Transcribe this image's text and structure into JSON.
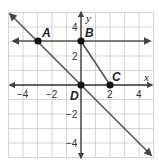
{
  "chart_data": {
    "type": "line",
    "title": "",
    "xlabel": "x",
    "ylabel": "y",
    "xlim": [
      -5,
      5
    ],
    "ylim": [
      -5,
      5
    ],
    "grid": true,
    "x_ticks": [
      -4,
      -2,
      2,
      4
    ],
    "y_ticks": [
      4,
      2,
      -2,
      -4
    ],
    "points": [
      {
        "label": "A",
        "x": -3,
        "y": 3
      },
      {
        "label": "B",
        "x": 0,
        "y": 3
      },
      {
        "label": "C",
        "x": 2,
        "y": 0
      },
      {
        "label": "D",
        "x": 0,
        "y": 0
      }
    ],
    "series": [
      {
        "name": "line through A and B (horizontal)",
        "kind": "line",
        "equation": "y = 3",
        "from": [
          -5,
          3
        ],
        "to": [
          5,
          3
        ]
      },
      {
        "name": "line through A and D",
        "kind": "line",
        "equation": "y = -x",
        "from": [
          -5,
          5
        ],
        "to": [
          5,
          -5
        ]
      },
      {
        "name": "segment BC",
        "kind": "segment",
        "from": [
          0,
          3
        ],
        "to": [
          2,
          0
        ]
      }
    ],
    "colors": {
      "grid": "#c8c8c8",
      "lines": "#555555",
      "axes": "#333333",
      "points": "#111111"
    }
  },
  "labels": {
    "x_axis": "x",
    "y_axis": "y",
    "tick_x": [
      "−4",
      "−2",
      "2",
      "4"
    ],
    "tick_y": [
      "4",
      "2",
      "−2",
      "−4"
    ],
    "point_A": "A",
    "point_B": "B",
    "point_C": "C",
    "point_D": "D"
  }
}
